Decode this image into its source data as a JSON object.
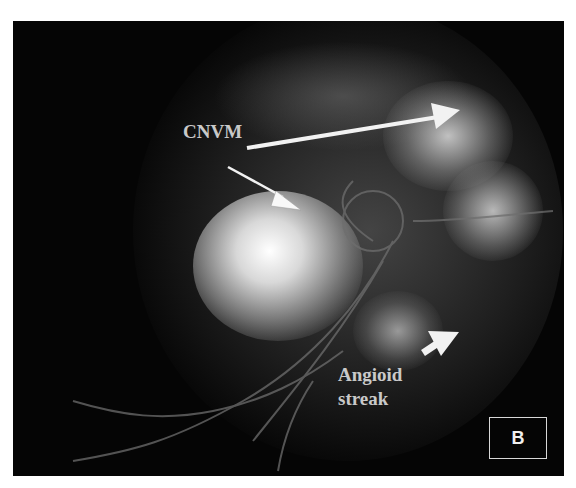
{
  "figure": {
    "type": "fluorescein angiogram",
    "panel_label": "B",
    "annotations": [
      {
        "id": "cnvm",
        "text": "CNVM"
      },
      {
        "id": "angioid",
        "line1": "Angioid",
        "line2": "streak"
      }
    ],
    "colors": {
      "background": "#050505",
      "label_text": "#c9c9c9",
      "arrow": "#f2f2f2",
      "page": "#ffffff"
    }
  }
}
